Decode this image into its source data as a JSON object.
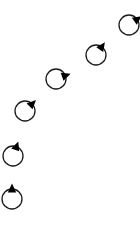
{
  "diagram": {
    "background": "#ffffff",
    "stroke_color": "#1a1a1a",
    "marker_color": "#000000",
    "circle_radius": 10,
    "poses": [
      {
        "id": 1,
        "x": 12,
        "y": 199,
        "heading_deg": 90
      },
      {
        "id": 2,
        "x": 13,
        "y": 156,
        "heading_deg": 70
      },
      {
        "id": 3,
        "x": 25,
        "y": 111,
        "heading_deg": 45
      },
      {
        "id": 4,
        "x": 56,
        "y": 79,
        "heading_deg": 20
      },
      {
        "id": 5,
        "x": 96,
        "y": 55,
        "heading_deg": 55
      },
      {
        "id": 6,
        "x": 129,
        "y": 25,
        "heading_deg": 35
      }
    ]
  }
}
